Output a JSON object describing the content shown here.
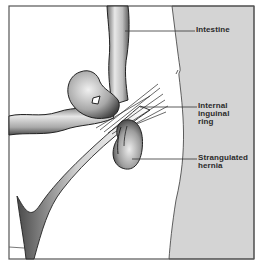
{
  "figure": {
    "colors": {
      "background": "#ffffff",
      "frame": "#555555",
      "abdominal_wall": "#d4d4d4",
      "leader_line": "#333333",
      "organ_outline": "#222222"
    }
  },
  "labels": {
    "intestine": {
      "lines": [
        "Intestine"
      ]
    },
    "internal_ring": {
      "lines": [
        "Internal",
        "inguinal",
        "ring"
      ]
    },
    "strangulated_hernia": {
      "lines": [
        "Strangulated",
        "hernia"
      ]
    }
  }
}
